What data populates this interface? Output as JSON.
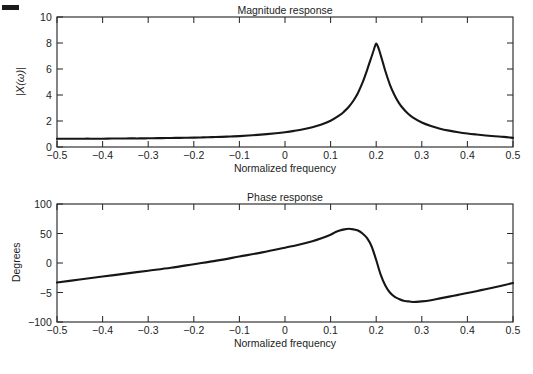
{
  "figure": {
    "background": "#ffffff",
    "curve_color": "#161616",
    "axis_color": "#2a2a2a",
    "artifact": {
      "name": "scan-dash-mark",
      "visible": true
    }
  },
  "panels": [
    {
      "id": "magnitude",
      "title": "Magnitude response",
      "xlabel": "Normalized frequency",
      "ylabel": "|X(ω)|",
      "xticks": [
        "−0.5",
        "−0.4",
        "−0.3",
        "−0.2",
        "−0.1",
        "0",
        "0.1",
        "0.2",
        "0.3",
        "0.4",
        "0.5"
      ],
      "yticks": [
        "0",
        "2",
        "4",
        "6",
        "8",
        "10"
      ]
    },
    {
      "id": "phase",
      "title": "Phase response",
      "xlabel": "Normalized frequency",
      "ylabel": "Degrees",
      "xticks": [
        "−0.5",
        "−0.4",
        "−0.3",
        "−0.2",
        "−0.1",
        "0",
        "0.1",
        "0.2",
        "0.3",
        "0.4",
        "0.5"
      ],
      "yticks": [
        "−100",
        "−5",
        "0",
        "50",
        "100"
      ]
    }
  ],
  "chart_data": [
    {
      "type": "line",
      "id": "magnitude-response",
      "title": "Magnitude response",
      "xlabel": "Normalized frequency",
      "ylabel": "|X(ω)|",
      "xlim": [
        -0.5,
        0.5
      ],
      "ylim": [
        0,
        10
      ],
      "xtick_values": [
        -0.5,
        -0.4,
        -0.3,
        -0.2,
        -0.1,
        0,
        0.1,
        0.2,
        0.3,
        0.4,
        0.5
      ],
      "ytick_values": [
        0,
        2,
        4,
        6,
        8,
        10
      ],
      "grid": false,
      "legend": "none",
      "annotations": [
        "resonant peak of magnitude 8.0 at normalized frequency 0.2"
      ],
      "x": [
        -0.5,
        -0.48,
        -0.46,
        -0.44,
        -0.42,
        -0.4,
        -0.38,
        -0.36,
        -0.34,
        -0.32,
        -0.3,
        -0.28,
        -0.26,
        -0.24,
        -0.22,
        -0.2,
        -0.18,
        -0.16,
        -0.14,
        -0.12,
        -0.1,
        -0.08,
        -0.06,
        -0.04,
        -0.02,
        0.0,
        0.02,
        0.04,
        0.06,
        0.08,
        0.1,
        0.12,
        0.13,
        0.14,
        0.15,
        0.16,
        0.17,
        0.175,
        0.18,
        0.185,
        0.19,
        0.195,
        0.2,
        0.205,
        0.21,
        0.215,
        0.22,
        0.23,
        0.24,
        0.25,
        0.26,
        0.27,
        0.28,
        0.3,
        0.32,
        0.34,
        0.36,
        0.38,
        0.4,
        0.42,
        0.44,
        0.46,
        0.48,
        0.5
      ],
      "y": [
        0.63,
        0.63,
        0.63,
        0.64,
        0.64,
        0.64,
        0.65,
        0.65,
        0.66,
        0.66,
        0.67,
        0.68,
        0.69,
        0.7,
        0.71,
        0.72,
        0.74,
        0.76,
        0.78,
        0.81,
        0.84,
        0.88,
        0.93,
        0.99,
        1.06,
        1.14,
        1.24,
        1.36,
        1.52,
        1.73,
        2.02,
        2.45,
        2.74,
        3.1,
        3.56,
        4.16,
        4.95,
        5.42,
        5.92,
        6.45,
        6.96,
        7.5,
        7.96,
        7.6,
        7.05,
        6.45,
        5.85,
        4.8,
        4.0,
        3.38,
        2.92,
        2.55,
        2.28,
        1.88,
        1.61,
        1.41,
        1.26,
        1.14,
        1.04,
        0.96,
        0.89,
        0.83,
        0.78,
        0.7
      ]
    },
    {
      "type": "line",
      "id": "phase-response",
      "title": "Phase response",
      "xlabel": "Normalized frequency",
      "ylabel": "Degrees",
      "xlim": [
        -0.5,
        0.5
      ],
      "ylim": [
        -100,
        100
      ],
      "xtick_values": [
        -0.5,
        -0.4,
        -0.3,
        -0.2,
        -0.1,
        0,
        0.1,
        0.2,
        0.3,
        0.4,
        0.5
      ],
      "ytick_values": [
        -100,
        -50,
        0,
        50,
        100
      ],
      "ytick_labels_as_drawn": [
        "−100",
        "−5",
        "0",
        "50",
        "100"
      ],
      "grid": false,
      "legend": "none",
      "annotations": [
        "phase rises linearly to about +58° near 0.13, drops sharply through 0.2, reaching about −66° near 0.28"
      ],
      "x": [
        -0.5,
        -0.45,
        -0.4,
        -0.35,
        -0.3,
        -0.25,
        -0.2,
        -0.15,
        -0.1,
        -0.05,
        0.0,
        0.03,
        0.06,
        0.08,
        0.1,
        0.11,
        0.12,
        0.13,
        0.14,
        0.15,
        0.16,
        0.17,
        0.18,
        0.19,
        0.2,
        0.21,
        0.22,
        0.23,
        0.24,
        0.25,
        0.26,
        0.27,
        0.28,
        0.3,
        0.32,
        0.34,
        0.36,
        0.38,
        0.4,
        0.43,
        0.46,
        0.5
      ],
      "y": [
        -33,
        -28,
        -23,
        -18,
        -13,
        -8,
        -2,
        4,
        11,
        18,
        26,
        31,
        37,
        42,
        48,
        52,
        55,
        57,
        58,
        57,
        55,
        50,
        42,
        28,
        5,
        -20,
        -38,
        -50,
        -57,
        -61,
        -64,
        -65,
        -66,
        -65,
        -63,
        -60,
        -57,
        -54,
        -51,
        -46,
        -41,
        -34
      ]
    }
  ]
}
